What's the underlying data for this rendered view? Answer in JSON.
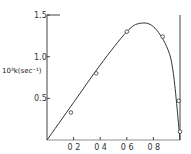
{
  "chart_data": {
    "type": "scatter",
    "title": "",
    "xlabel": "",
    "ylabel": "10³k(sec⁻¹)",
    "xlim": [
      0,
      1.0
    ],
    "ylim": [
      0,
      1.5
    ],
    "x_ticks": [
      "0.2",
      "0.4",
      "0.6",
      "0.8"
    ],
    "y_ticks": [
      "0.5",
      "1.0",
      "1.5"
    ],
    "grid": false,
    "legend": null,
    "series": [
      {
        "name": "measured",
        "marker": "open-circle",
        "x": [
          0.18,
          0.37,
          0.6,
          0.87,
          0.99,
          1.0
        ],
        "y": [
          0.33,
          0.8,
          1.3,
          1.24,
          0.47,
          0.1
        ]
      },
      {
        "name": "fit curve",
        "style": "line",
        "x": [
          0,
          0.2,
          0.4,
          0.6,
          0.7,
          0.8,
          0.9,
          0.95,
          1.0
        ],
        "y": [
          0,
          0.45,
          0.9,
          1.3,
          1.4,
          1.36,
          1.12,
          0.8,
          0
        ]
      }
    ]
  }
}
